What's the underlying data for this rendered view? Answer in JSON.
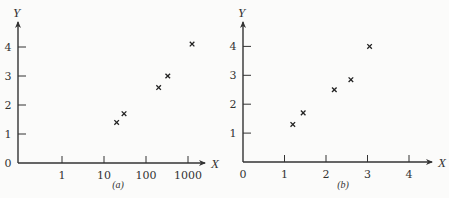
{
  "chart_data": [
    {
      "type": "scatter",
      "caption": "(a)",
      "xlabel": "X",
      "ylabel": "Y",
      "xscale": "log",
      "x_ticks": [
        "1",
        "10",
        "100",
        "1000"
      ],
      "y_ticks": [
        "1",
        "2",
        "3",
        "4"
      ],
      "origin_label": "0",
      "ylim": [
        0,
        4.5
      ],
      "grid": false,
      "marker": "x",
      "points": [
        {
          "x": 20,
          "y": 1.4
        },
        {
          "x": 30,
          "y": 1.7
        },
        {
          "x": 200,
          "y": 2.6
        },
        {
          "x": 330,
          "y": 3.0
        },
        {
          "x": 1250,
          "y": 4.1
        }
      ]
    },
    {
      "type": "scatter",
      "caption": "(b)",
      "xlabel": "X",
      "ylabel": "Y",
      "xscale": "linear",
      "x_ticks": [
        "0",
        "1",
        "2",
        "3",
        "4"
      ],
      "y_ticks": [
        "1",
        "2",
        "3",
        "4"
      ],
      "xlim": [
        0,
        4.5
      ],
      "ylim": [
        0,
        4.5
      ],
      "grid": false,
      "marker": "x",
      "points": [
        {
          "x": 1.2,
          "y": 1.3
        },
        {
          "x": 1.45,
          "y": 1.7
        },
        {
          "x": 2.2,
          "y": 2.5
        },
        {
          "x": 2.6,
          "y": 2.85
        },
        {
          "x": 3.05,
          "y": 4.0
        }
      ]
    }
  ],
  "colors": {
    "ink": "#333333",
    "background": "#fbfbfa"
  }
}
